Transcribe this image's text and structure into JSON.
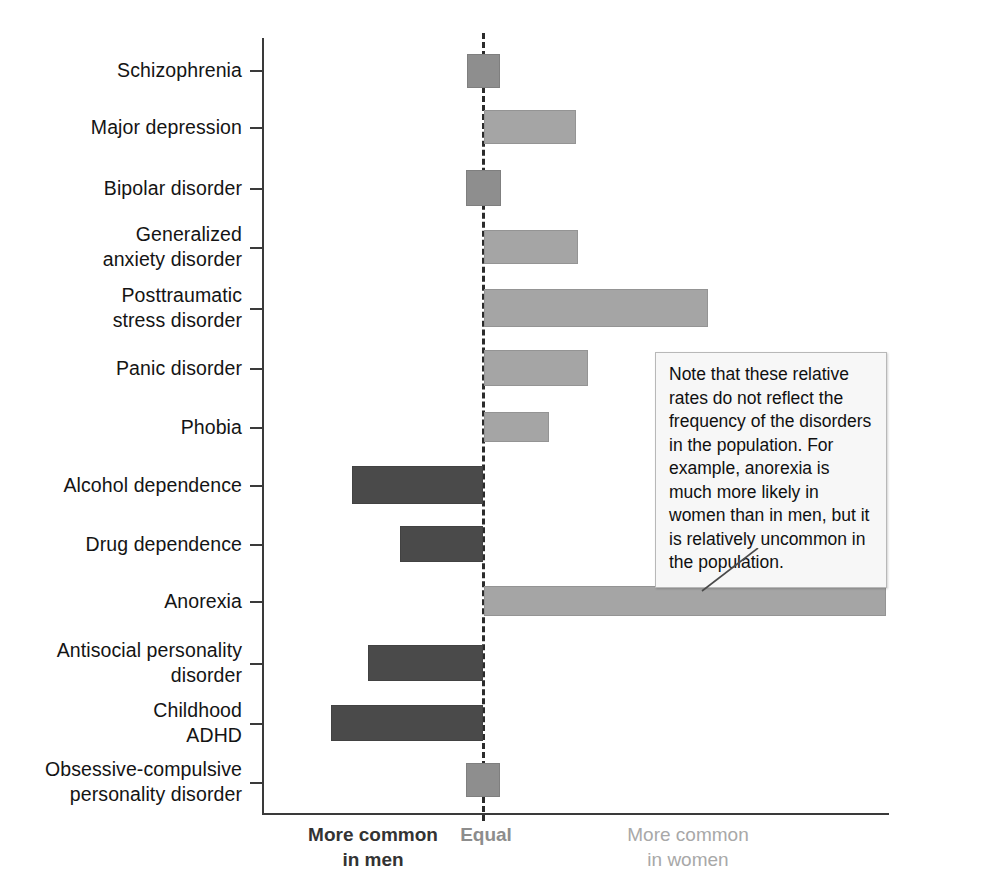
{
  "chart_data": {
    "type": "bar",
    "title": "",
    "subtitle": "",
    "orientation": "horizontal",
    "xlabel": "",
    "ylabel": "",
    "grid": false,
    "legend_position": "below-axis",
    "xlim": [
      -1.0,
      1.85
    ],
    "zero_label": "Equal",
    "axis_captions": {
      "left": "More common\nin men",
      "center": "Equal",
      "right": "More common\nin women"
    },
    "colors": {
      "more_common_in_men": "#4a4a4a",
      "more_common_in_women": "#a5a5a5",
      "about_equal": "#8e8e8e",
      "axis": "#3a3a3a",
      "zero_line": "#2b2b2b",
      "callout_background": "#f7f7f7",
      "callout_border": "#b8b8b8"
    },
    "categories": [
      "Schizophrenia",
      "Major depression",
      "Bipolar disorder",
      "Generalized\nanxiety disorder",
      "Posttraumatic\nstress disorder",
      "Panic disorder",
      "Phobia",
      "Alcohol dependence",
      "Drug dependence",
      "Anorexia",
      "Antisocial personality\ndisorder",
      "Childhood\nADHD",
      "Obsessive-compulsive\npersonality disorder"
    ],
    "values": [
      0.04,
      0.42,
      0.06,
      0.44,
      1.08,
      0.51,
      0.31,
      -0.6,
      -0.38,
      1.8,
      -0.52,
      -0.67,
      0.05
    ],
    "series": [
      {
        "name": "Relative rate (men ↔ women)",
        "values": [
          0.04,
          0.42,
          0.06,
          0.44,
          1.08,
          0.51,
          0.31,
          -0.6,
          -0.38,
          1.8,
          -0.52,
          -0.67,
          0.05
        ]
      }
    ],
    "bars": [
      {
        "category": "Schizophrenia",
        "value": 0.04,
        "direction": "equal",
        "px_left": 467,
        "px_right": 500,
        "px_top": 54,
        "px_height": 34
      },
      {
        "category": "Major depression",
        "value": 0.42,
        "direction": "women",
        "px_left": 484,
        "px_right": 576,
        "px_top": 110,
        "px_height": 34
      },
      {
        "category": "Bipolar disorder",
        "value": 0.06,
        "direction": "equal",
        "px_left": 466,
        "px_right": 501,
        "px_top": 170,
        "px_height": 36
      },
      {
        "category": "Generalized anxiety disorder",
        "value": 0.44,
        "direction": "women",
        "px_left": 484,
        "px_right": 578,
        "px_top": 230,
        "px_height": 34
      },
      {
        "category": "Posttraumatic stress disorder",
        "value": 1.08,
        "direction": "women",
        "px_left": 484,
        "px_right": 708,
        "px_top": 289,
        "px_height": 38
      },
      {
        "category": "Panic disorder",
        "value": 0.51,
        "direction": "women",
        "px_left": 484,
        "px_right": 588,
        "px_top": 350,
        "px_height": 36
      },
      {
        "category": "Phobia",
        "value": 0.31,
        "direction": "women",
        "px_left": 484,
        "px_right": 549,
        "px_top": 412,
        "px_height": 30
      },
      {
        "category": "Alcohol dependence",
        "value": -0.6,
        "direction": "men",
        "px_left": 352,
        "px_right": 483,
        "px_top": 466,
        "px_height": 38
      },
      {
        "category": "Drug dependence",
        "value": -0.38,
        "direction": "men",
        "px_left": 400,
        "px_right": 483,
        "px_top": 526,
        "px_height": 36
      },
      {
        "category": "Anorexia",
        "value": 1.8,
        "direction": "women",
        "px_left": 484,
        "px_right": 886,
        "px_top": 586,
        "px_height": 30
      },
      {
        "category": "Antisocial personality disorder",
        "value": -0.52,
        "direction": "men",
        "px_left": 368,
        "px_right": 483,
        "px_top": 645,
        "px_height": 36
      },
      {
        "category": "Childhood ADHD",
        "value": -0.67,
        "direction": "men",
        "px_left": 331,
        "px_right": 483,
        "px_top": 705,
        "px_height": 36
      },
      {
        "category": "Obsessive-compulsive personality disorder",
        "value": 0.05,
        "direction": "equal",
        "px_left": 466,
        "px_right": 500,
        "px_top": 763,
        "px_height": 34
      }
    ],
    "tick_rows": [
      {
        "label": "Schizophrenia",
        "px_tick_y": 70,
        "px_label_top": 58,
        "lines": 1
      },
      {
        "label": "Major depression",
        "px_tick_y": 127,
        "px_label_top": 115,
        "lines": 1
      },
      {
        "label": "Bipolar disorder",
        "px_tick_y": 188,
        "px_label_top": 176,
        "lines": 1
      },
      {
        "label": "Generalized\nanxiety disorder",
        "px_tick_y": 247,
        "px_label_top": 222,
        "lines": 2
      },
      {
        "label": "Posttraumatic\nstress disorder",
        "px_tick_y": 308,
        "px_label_top": 283,
        "lines": 2
      },
      {
        "label": "Panic disorder",
        "px_tick_y": 368,
        "px_label_top": 356,
        "lines": 1
      },
      {
        "label": "Phobia",
        "px_tick_y": 427,
        "px_label_top": 415,
        "lines": 1
      },
      {
        "label": "Alcohol dependence",
        "px_tick_y": 485,
        "px_label_top": 473,
        "lines": 1
      },
      {
        "label": "Drug dependence",
        "px_tick_y": 544,
        "px_label_top": 532,
        "lines": 1
      },
      {
        "label": "Anorexia",
        "px_tick_y": 601,
        "px_label_top": 589,
        "lines": 1
      },
      {
        "label": "Antisocial personality\ndisorder",
        "px_tick_y": 663,
        "px_label_top": 638,
        "lines": 2
      },
      {
        "label": "Childhood\nADHD",
        "px_tick_y": 723,
        "px_label_top": 698,
        "lines": 2
      },
      {
        "label": "Obsessive-compulsive\npersonality disorder",
        "px_tick_y": 782,
        "px_label_top": 757,
        "lines": 2
      }
    ],
    "annotation": {
      "text": "Note that these relative rates do not reflect the frequency of the disorders in the population. For example, anorexia is much more likely in women than in men, but it is relatively uncommon in the population.",
      "points_to": "Anorexia"
    }
  }
}
